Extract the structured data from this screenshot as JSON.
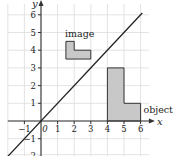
{
  "diagram": {
    "type": "coordinate-grid-reflection",
    "axes": {
      "x_label": "x",
      "y_label": "y",
      "x_range": [
        -2,
        6.5
      ],
      "y_range": [
        -2,
        6.5
      ],
      "x_ticks": [
        -1,
        0,
        1,
        2,
        3,
        4,
        5,
        6
      ],
      "x_tick_labels": [
        "−1",
        "0",
        "1",
        "2",
        "3",
        "4",
        "5",
        "6"
      ],
      "y_ticks": [
        -2,
        -1,
        1,
        2,
        3,
        4,
        5,
        6
      ],
      "y_tick_labels": [
        "−2",
        "−1",
        "1",
        "2",
        "3",
        "4",
        "5",
        "6"
      ],
      "grid": true
    },
    "line": {
      "label": "y = x",
      "from": [
        -2,
        -2
      ],
      "to": [
        6.1,
        6.1
      ],
      "color": "#222222"
    },
    "shapes": [
      {
        "name": "object",
        "label": "object",
        "points": [
          [
            4,
            0
          ],
          [
            4,
            3
          ],
          [
            5,
            3
          ],
          [
            5,
            1
          ],
          [
            6,
            1
          ],
          [
            6,
            0
          ]
        ],
        "fill": "#c8c8c8",
        "stroke": "#333333"
      },
      {
        "name": "image",
        "label": "image",
        "points": [
          [
            1.5,
            3.5
          ],
          [
            1.5,
            4.5
          ],
          [
            2,
            4.5
          ],
          [
            2,
            4
          ],
          [
            3,
            4
          ],
          [
            3,
            3.5
          ]
        ],
        "fill": "#c8c8c8",
        "stroke": "#333333"
      }
    ],
    "colors": {
      "grid": "#dcdcdc",
      "axis": "#333333",
      "background": "#ffffff"
    }
  }
}
